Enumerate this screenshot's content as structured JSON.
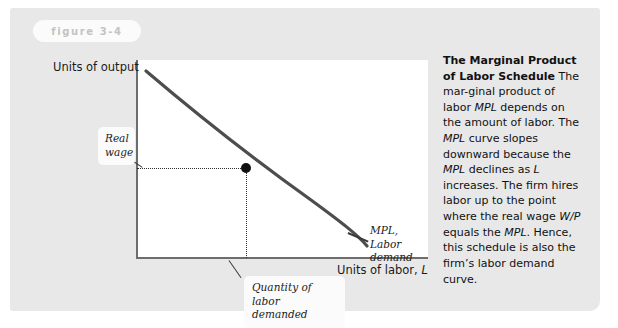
{
  "figure": {
    "tag_label": "figure 3-4"
  },
  "chart_data": {
    "type": "line",
    "title": "Marginal Product of Labor Schedule",
    "xlabel": "Units of labor, L",
    "ylabel": "Units of output",
    "grid": false,
    "legend": "none",
    "series": [
      {
        "name": "MPL, Labor demand",
        "shape": "convex-decreasing",
        "x": [
          0.04,
          0.2,
          0.38,
          0.56,
          0.74,
          0.9
        ],
        "y": [
          0.95,
          0.78,
          0.62,
          0.48,
          0.36,
          0.27
        ]
      }
    ],
    "annotations": [
      {
        "name": "real-wage",
        "label": "Real\nwage",
        "axis": "y",
        "value": 0.545
      },
      {
        "name": "quantity-of-labor-demanded",
        "label": "Quantity of labor\ndemanded",
        "axis": "x",
        "value": 0.377
      },
      {
        "name": "equilibrium-point",
        "x": 0.377,
        "y": 0.545
      }
    ]
  },
  "axes": {
    "y_title": "Units of output",
    "x_title_text": "Units of labor, ",
    "x_title_var": "L"
  },
  "callouts": {
    "real_wage_line1": "Real",
    "real_wage_line2": "wage",
    "quantity_line1": "Quantity of labor",
    "quantity_line2": "demanded",
    "mpl_line1": "MPL, Labor",
    "mpl_line2": "demand"
  },
  "caption": {
    "title_line1": "The Marginal Product of",
    "title_line2": "Labor Schedule",
    "body_parts": [
      {
        "text": " The mar-",
        "style": "normal"
      },
      {
        "text": "ginal product of labor ",
        "style": "normal"
      },
      {
        "text": "MPL",
        "style": "italic"
      },
      {
        "text": " depends on the amount of labor. The ",
        "style": "normal"
      },
      {
        "text": "MPL",
        "style": "italic"
      },
      {
        "text": " curve slopes downward because the ",
        "style": "normal"
      },
      {
        "text": "MPL",
        "style": "italic"
      },
      {
        "text": " declines as ",
        "style": "normal"
      },
      {
        "text": "L",
        "style": "italic"
      },
      {
        "text": " increases. The firm hires labor up to the point where the real wage ",
        "style": "normal"
      },
      {
        "text": "W/P",
        "style": "italic"
      },
      {
        "text": " equals the ",
        "style": "normal"
      },
      {
        "text": "MPL",
        "style": "italic"
      },
      {
        "text": ". Hence, this schedule is also the firm’s labor demand curve.",
        "style": "normal"
      }
    ]
  },
  "colors": {
    "card_background": "#e8e8e8",
    "plot_background": "#ffffff",
    "curve": "#4d4d4d",
    "axis": "#6d6d6d",
    "dot": "#101010",
    "tag_text": "#c3c3c3",
    "text": "#111111"
  }
}
